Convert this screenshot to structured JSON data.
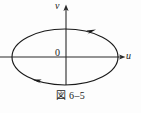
{
  "figure": {
    "caption": "図 6–5",
    "caption_number": "6–5",
    "background_color": "#fdfdfd",
    "stroke_color": "#1a1a1a"
  },
  "axes": {
    "horizontal": {
      "label": "u",
      "name": "u-axis",
      "y_position": 57,
      "x_start": 0,
      "x_end": 124,
      "has_arrow": true,
      "arrow_direction": "right"
    },
    "vertical": {
      "label": "v",
      "name": "v-axis",
      "x_position": 66,
      "y_start": 6,
      "y_end": 85,
      "has_arrow": true,
      "arrow_direction": "up"
    },
    "origin_label": "0"
  },
  "curve": {
    "name": "closed-orbit-ellipse",
    "shape": "ellipse",
    "center_x": 65,
    "center_y": 57,
    "radius_x": 53,
    "radius_y": 28,
    "stroke_width": 1.1,
    "direction": "clockwise",
    "arrow_markers": [
      {
        "name": "orbit-arrow-upper-right",
        "x": 90,
        "y": 31,
        "points": "right"
      },
      {
        "name": "orbit-arrow-lower-left",
        "x": 40,
        "y": 82,
        "points": "left"
      }
    ]
  }
}
